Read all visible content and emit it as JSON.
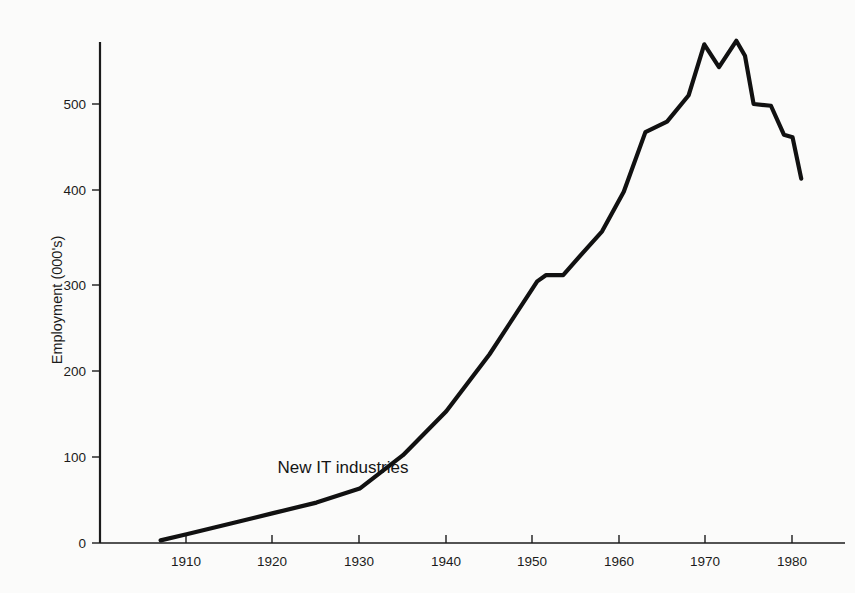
{
  "chart_data": {
    "type": "line",
    "title": "",
    "xlabel": "",
    "ylabel": "Employment (000's)",
    "xlim": [
      1900,
      1985
    ],
    "ylim": [
      0,
      585
    ],
    "grid": false,
    "legend": "none",
    "x_ticks": [
      1910,
      1920,
      1930,
      1940,
      1950,
      1960,
      1970,
      1980
    ],
    "x_tick_labels": [
      "1910",
      "1920",
      "1930",
      "1940",
      "1950",
      "1960",
      "1970",
      "1980"
    ],
    "y_ticks": [
      0,
      100,
      200,
      300,
      400,
      500
    ],
    "y_tick_labels": [
      "0",
      "100",
      "200",
      "300",
      "400",
      "500"
    ],
    "annotations": [
      {
        "text": "New IT industries",
        "x": 1920.5,
        "y": 80
      }
    ],
    "series": [
      {
        "name": "New IT industries",
        "color": "#111111",
        "x": [
          1907.0,
          1910.0,
          1915.0,
          1920.0,
          1925.0,
          1930.0,
          1935.0,
          1940.0,
          1945.0,
          1950.5,
          1951.5,
          1953.5,
          1955.0,
          1958.0,
          1960.5,
          1963.0,
          1965.5,
          1968.0,
          1969.8,
          1971.5,
          1973.5,
          1974.5,
          1975.5,
          1977.5,
          1979.0,
          1980.0,
          1981.0
        ],
        "y": [
          3,
          10,
          22,
          34,
          46,
          62,
          100,
          150,
          215,
          298,
          305,
          305,
          322,
          355,
          400,
          468,
          480,
          510,
          568,
          542,
          572,
          555,
          500,
          498,
          465,
          462,
          415
        ]
      }
    ]
  },
  "page": {
    "background_color": "#fbfbfa",
    "ink_color": "#111111"
  }
}
